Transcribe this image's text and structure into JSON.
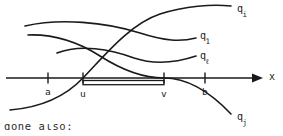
{
  "figure": {
    "kind": "line-plot-sketch",
    "background_color": "#ffffff",
    "ink_color": "#1a1a1a",
    "axis": {
      "name": "x",
      "arrow": "right",
      "y_pixel": 78,
      "x_start": 6,
      "x_end": 258
    },
    "ticks": [
      {
        "id": "a",
        "label": "a",
        "x": 48
      },
      {
        "id": "u",
        "label": "u",
        "x": 83
      },
      {
        "id": "v",
        "label": "v",
        "x": 164
      },
      {
        "id": "b",
        "label": "b",
        "x": 205
      }
    ],
    "interval": {
      "from_label": "u",
      "to_label": "v",
      "x_start": 83,
      "x_end": 164,
      "style": "thin-double-line-bar"
    },
    "curve_labels": [
      {
        "id": "qi",
        "base": "q",
        "subscript": "i",
        "x": 237,
        "y": 4
      },
      {
        "id": "q1",
        "base": "q",
        "subscript": "1",
        "x": 200,
        "y": 31
      },
      {
        "id": "ql",
        "base": "q",
        "subscript": "ℓ",
        "x": 200,
        "y": 51
      },
      {
        "id": "qj",
        "base": "q",
        "subscript": "j",
        "x": 237,
        "y": 112
      }
    ],
    "curves": [
      {
        "id": "q1",
        "label": "q₁",
        "description": "gently rising then falling arc across the top, ends at q1 label height",
        "path": "M 25,26 C 60,18 105,22 140,33 C 165,41 180,42 196,38"
      },
      {
        "id": "ql",
        "label": "qℓ",
        "description": "shallow arc dipping in the middle, ends at q-ell label height",
        "path": "M 57,53 C 80,44 110,49 134,58 C 155,65 178,62 196,56"
      },
      {
        "id": "qi",
        "label": "qᵢ",
        "description": "monotone increasing S-curve from lower-left, crosses axis near u, rises to upper right",
        "path": "M 10,110 C 35,108 62,100 83,78 C 105,55 130,24 160,14 C 185,6 212,4 231,6"
      },
      {
        "id": "qj",
        "label": "qⱼ",
        "description": "monotone decreasing S-curve from upper-left, crosses axis near v, falls to lower right",
        "path": "M 28,35 C 55,34 78,42 100,56 C 125,72 148,78 164,78 C 190,78 214,96 231,114"
      }
    ],
    "bottom_cropped_text": "done also:"
  }
}
